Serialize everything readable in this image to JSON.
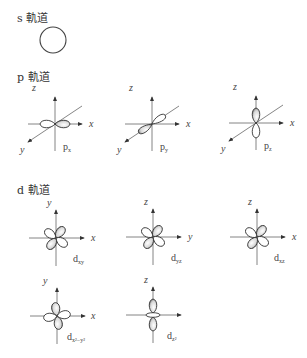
{
  "sections": {
    "s": {
      "title": "s 軌道"
    },
    "p": {
      "title": "p 軌道"
    },
    "d": {
      "title": "d 軌道"
    }
  },
  "orbitals": {
    "s": {
      "name": "s",
      "shape": "circle"
    },
    "px": {
      "label_main": "p",
      "label_sub": "x",
      "axes": {
        "vertical": "z",
        "horizontal": "x",
        "diagonal": "y"
      }
    },
    "py": {
      "label_main": "p",
      "label_sub": "y",
      "axes": {
        "vertical": "z",
        "horizontal": "x",
        "diagonal": "y"
      }
    },
    "pz": {
      "label_main": "p",
      "label_sub": "z",
      "axes": {
        "vertical": "z",
        "horizontal": "x",
        "diagonal": "y"
      }
    },
    "dxy": {
      "label_main": "d",
      "label_sub": "xy",
      "axes": {
        "vertical": "y",
        "horizontal": "x"
      }
    },
    "dyz": {
      "label_main": "d",
      "label_sub": "yz",
      "axes": {
        "vertical": "z",
        "horizontal": "y"
      }
    },
    "dxz": {
      "label_main": "d",
      "label_sub": "xz",
      "axes": {
        "vertical": "z",
        "horizontal": "x"
      }
    },
    "dx2y2": {
      "label_main": "d",
      "label_sub": "x²−y²",
      "axes": {
        "vertical": "y",
        "horizontal": "x"
      }
    },
    "dz2": {
      "label_main": "d",
      "label_sub": "z²",
      "axes": {
        "vertical": "z",
        "horizontal": ""
      }
    }
  },
  "colors": {
    "line": "#555555",
    "lobe_fill": "#ffffff",
    "lobe_shade": "#9a9a9a"
  }
}
